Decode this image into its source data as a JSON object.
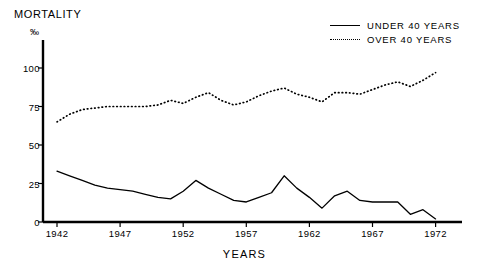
{
  "chart_data": {
    "type": "line",
    "title": "MORTALITY",
    "xlabel": "YEARS",
    "ylabel": "‰",
    "xlim": [
      1941,
      1973
    ],
    "ylim": [
      0,
      110
    ],
    "grid": false,
    "legend_position": "top-right",
    "yticks": [
      0,
      25,
      50,
      75,
      100
    ],
    "ytick_labels": [
      "0",
      "25",
      "50",
      "75",
      "100"
    ],
    "xticks": [
      1942,
      1947,
      1952,
      1957,
      1962,
      1967,
      1972
    ],
    "xtick_labels": [
      "1942",
      "1947",
      "1952",
      "1957",
      "1962",
      "1967",
      "1972"
    ],
    "x": [
      1942,
      1943,
      1944,
      1945,
      1946,
      1947,
      1948,
      1949,
      1950,
      1951,
      1952,
      1953,
      1954,
      1955,
      1956,
      1957,
      1958,
      1959,
      1960,
      1961,
      1962,
      1963,
      1964,
      1965,
      1966,
      1967,
      1968,
      1969,
      1970,
      1971,
      1972
    ],
    "series": [
      {
        "name": "UNDER 40 YEARS",
        "style": "solid",
        "color": "#000000",
        "values": [
          33,
          30,
          27,
          24,
          22,
          21,
          20,
          18,
          16,
          15,
          20,
          27,
          22,
          18,
          14,
          13,
          16,
          19,
          30,
          22,
          16,
          9,
          17,
          20,
          14,
          13,
          13,
          13,
          5,
          8,
          2
        ]
      },
      {
        "name": "OVER 40 YEARS",
        "style": "dotted",
        "color": "#000000",
        "values": [
          65,
          70,
          73,
          74,
          75,
          75,
          75,
          75,
          76,
          79,
          77,
          81,
          84,
          79,
          76,
          78,
          82,
          85,
          87,
          83,
          81,
          78,
          84,
          84,
          83,
          86,
          89,
          91,
          88,
          92,
          97
        ]
      }
    ]
  },
  "legend": {
    "items": [
      {
        "label": "UNDER 40 YEARS",
        "style": "solid"
      },
      {
        "label": "OVER 40 YEARS",
        "style": "dotted"
      }
    ]
  }
}
